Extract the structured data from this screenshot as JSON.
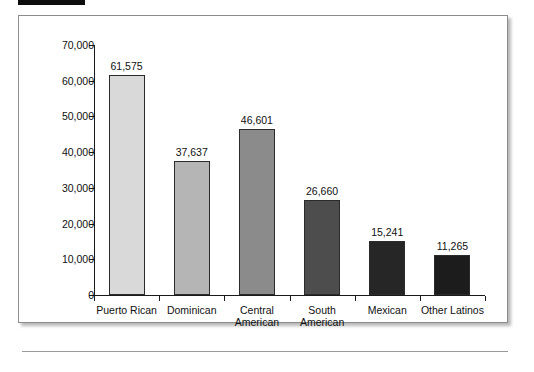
{
  "figure": {
    "top_mark_label": "redaction-bar",
    "background": "#ffffff",
    "border_color": "#8c8c8c"
  },
  "chart_data": {
    "type": "bar",
    "title": "",
    "xlabel": "",
    "ylabel": "",
    "grid": false,
    "legend": "none",
    "ylim": [
      0,
      70000
    ],
    "ytick_labels": [
      "0",
      "10,000",
      "20,000",
      "30,000",
      "40,000",
      "50,000",
      "60,000",
      "70,000"
    ],
    "ytick_values": [
      0,
      10000,
      20000,
      30000,
      40000,
      50000,
      60000,
      70000
    ],
    "categories": [
      "Puerto Rican",
      "Dominican",
      "Central American",
      "South American",
      "Mexican",
      "Other Latinos"
    ],
    "category_lines": [
      [
        "Puerto Rican"
      ],
      [
        "Dominican"
      ],
      [
        "Central",
        "American"
      ],
      [
        "South",
        "American"
      ],
      [
        "Mexican"
      ],
      [
        "Other Latinos"
      ]
    ],
    "values": [
      61575,
      37637,
      46601,
      26660,
      15241,
      11265
    ],
    "value_labels": [
      "61,575",
      "37,637",
      "46,601",
      "26,660",
      "15,241",
      "11,265"
    ],
    "bar_colors": [
      "#d9d9d9",
      "#b5b5b5",
      "#8b8b8b",
      "#4d4d4d",
      "#262626",
      "#1c1c1c"
    ],
    "bar_edge_color": "#2b2b2b",
    "axis_color": "#1a1a1a"
  }
}
